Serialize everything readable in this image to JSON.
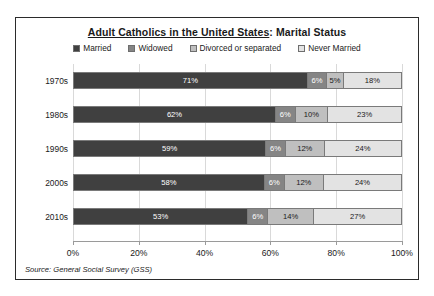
{
  "chart_data": {
    "type": "bar",
    "orientation": "horizontal",
    "stacked": true,
    "stack_mode": "percent",
    "title": "Adult Catholics in the United States: Marital Status",
    "title_underlined_part": "Adult Catholics in the United States",
    "title_plain_part": ": Marital Status",
    "xlabel": "",
    "ylabel": "",
    "xlim": [
      0,
      100
    ],
    "grid": true,
    "grid_axis": "x",
    "legend_position": "top",
    "source_note": "Source: General Social Survey (GSS)",
    "categories": [
      "1970s",
      "1980s",
      "1990s",
      "2000s",
      "2010s"
    ],
    "xticks": [
      0,
      20,
      40,
      60,
      80,
      100
    ],
    "xtick_labels": [
      "0%",
      "20%",
      "40%",
      "60%",
      "80%",
      "100%"
    ],
    "series": [
      {
        "name": "Married",
        "color": "#404040",
        "values": [
          71,
          62,
          59,
          58,
          53
        ],
        "labels": [
          "71%",
          "62%",
          "59%",
          "58%",
          "53%"
        ]
      },
      {
        "name": "Widowed",
        "color": "#858585",
        "values": [
          6,
          6,
          6,
          6,
          6
        ],
        "labels": [
          "6%",
          "6%",
          "6%",
          "6%",
          "6%"
        ]
      },
      {
        "name": "Divorced or separated",
        "color": "#bfbfbf",
        "values": [
          5,
          10,
          12,
          12,
          14
        ],
        "labels": [
          "5%",
          "10%",
          "12%",
          "12%",
          "14%"
        ]
      },
      {
        "name": "Never Married",
        "color": "#e3e3e3",
        "values": [
          18,
          23,
          24,
          24,
          27
        ],
        "labels": [
          "18%",
          "23%",
          "24%",
          "24%",
          "27%"
        ]
      }
    ]
  }
}
